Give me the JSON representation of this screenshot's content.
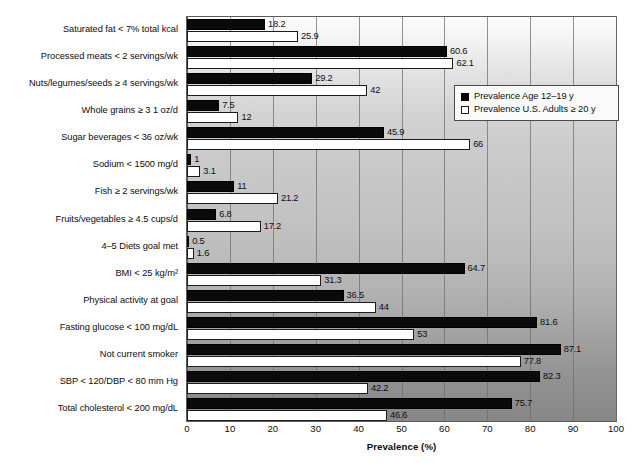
{
  "chart_data": {
    "type": "bar",
    "orientation": "horizontal",
    "title": "",
    "xlabel": "Prevalence (%)",
    "ylabel": "",
    "xlim": [
      0,
      100
    ],
    "xticks": [
      0,
      10,
      20,
      30,
      40,
      50,
      60,
      70,
      80,
      90,
      100
    ],
    "xtick_labels": [
      "0",
      "10",
      "20",
      "30",
      "40",
      "50",
      "60",
      "70",
      "80",
      "90",
      "100"
    ],
    "grid": "vertical",
    "legend_position": "upper-right-inside",
    "categories": [
      "Saturated fat < 7% total kcal",
      "Processed meats < 2 servings/wk",
      "Nuts/legumes/seeds ≥ 4 servings/wk",
      "Whole grains ≥ 3 1 oz/d",
      "Sugar beverages < 36 oz/wk",
      "Sodium < 1500 mg/d",
      "Fish ≥ 2 servings/wk",
      "Fruits/vegetables ≥ 4.5 cups/d",
      "4–5 Diets goal met",
      "BMI < 25 kg/m²",
      "Physical activity at goal",
      "Fasting glucose < 100 mg/dL",
      "Not current smoker",
      "SBP < 120/DBP < 80 mm Hg",
      "Total cholesterol < 200 mg/dL"
    ],
    "series": [
      {
        "name": "Prevalence Age 12–19 y",
        "color": "#0a0a0a",
        "values": [
          18.2,
          60.6,
          29.2,
          7.5,
          45.9,
          1,
          11,
          6.8,
          0.5,
          64.7,
          36.5,
          81.6,
          87.1,
          82.3,
          75.7
        ],
        "labels": [
          "18.2",
          "60.6",
          "29.2",
          "7.5",
          "45.9",
          "1",
          "11",
          "6.8",
          "0.5",
          "64.7",
          "36.5",
          "81.6",
          "87.1",
          "82.3",
          "75.7"
        ]
      },
      {
        "name": "Prevalence U.S. Adults ≥ 20 y",
        "color": "#ffffff",
        "values": [
          25.9,
          62.1,
          42,
          12,
          66,
          3.1,
          21.2,
          17.2,
          1.6,
          31.3,
          44,
          53,
          77.8,
          42.2,
          46.6
        ],
        "labels": [
          "25.9",
          "62.1",
          "42",
          "12",
          "66",
          "3.1",
          "21.2",
          "17.2",
          "1.6",
          "31.3",
          "44",
          "53",
          "77.8",
          "42.2",
          "46.6"
        ]
      }
    ]
  },
  "legend": {
    "items": [
      {
        "label": "Prevalence Age 12–19 y",
        "swatch": "filled-black"
      },
      {
        "label": "Prevalence U.S. Adults ≥ 20 y",
        "swatch": "open-white"
      }
    ]
  },
  "axis": {
    "x_title": "Prevalence (%)"
  }
}
